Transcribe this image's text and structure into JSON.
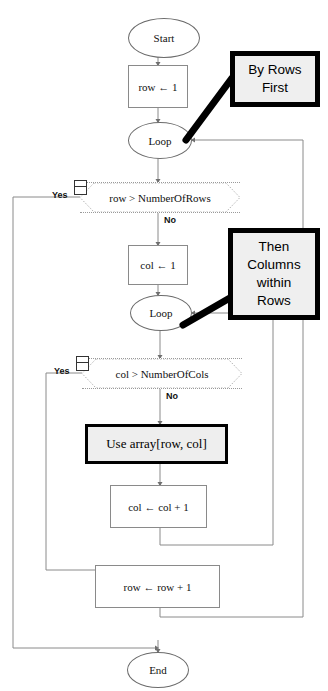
{
  "diagram": {
    "colors": {
      "callout_border": "#000000",
      "callout_fill": "#efefef",
      "emphasis_border": "#000000",
      "emphasis_fill": "#eeeeee",
      "shape_stroke": "#6b6b6b",
      "connector": "#8a8a8a",
      "background": "#ffffff"
    }
  },
  "nodes": {
    "start": {
      "label": "Start",
      "shape": "oval"
    },
    "row_init": {
      "label": "row ← 1",
      "shape": "process"
    },
    "outer_loop": {
      "label": "Loop",
      "shape": "oval"
    },
    "row_test": {
      "label": "row > NumberOfRows",
      "shape": "decision"
    },
    "col_init": {
      "label": "col ← 1",
      "shape": "process"
    },
    "inner_loop": {
      "label": "Loop",
      "shape": "oval"
    },
    "col_test": {
      "label": "col > NumberOfCols",
      "shape": "decision"
    },
    "use_array": {
      "label": "Use array[row, col]",
      "shape": "process-emphasis"
    },
    "col_incr": {
      "label": "col ← col + 1",
      "shape": "process"
    },
    "row_incr": {
      "label": "row ← row + 1",
      "shape": "process"
    },
    "end": {
      "label": "End",
      "shape": "oval"
    }
  },
  "branch_labels": {
    "row_test_yes": "Yes",
    "row_test_no": "No",
    "col_test_yes": "Yes",
    "col_test_no": "No"
  },
  "callouts": {
    "by_rows": {
      "lines": [
        "By Rows",
        "First"
      ],
      "points_to": "outer_loop"
    },
    "then_cols": {
      "lines": [
        "Then",
        "Columns",
        "within",
        "Rows"
      ],
      "points_to": "inner_loop"
    }
  }
}
